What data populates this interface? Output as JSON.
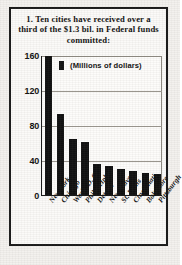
{
  "headline": {
    "number": "1.",
    "text": "Ten cities have received over a third of the $1.3 bil. in Federal funds committed:"
  },
  "legend": {
    "label": "(Millions of dollars)",
    "swatch_color": "#101010"
  },
  "colors": {
    "bar": "#101010",
    "frame": "#1a1a1a",
    "paper": "#f3f1ee",
    "gridline": "#9a968e"
  },
  "chart_data": {
    "type": "bar",
    "title": "Ten cities have received over a third of the $1.3 bil. in Federal funds committed:",
    "subtitle": "(Millions of dollars)",
    "xlabel": "",
    "ylabel": "",
    "ylim": [
      0,
      160
    ],
    "yticks": [
      160,
      120,
      80,
      40,
      0
    ],
    "grid": true,
    "legend_position": "top-left-inside",
    "categories": [
      "New York",
      "Chicago",
      "Wash. D. C.",
      "Philadelphia",
      "Detroit",
      "New Haven",
      "St. Louis",
      "Cincinnati",
      "Baltimore",
      "Pittsburgh"
    ],
    "values": [
      159,
      93,
      64,
      61,
      36,
      33,
      30,
      27,
      25,
      24
    ],
    "units": "Millions of dollars"
  }
}
